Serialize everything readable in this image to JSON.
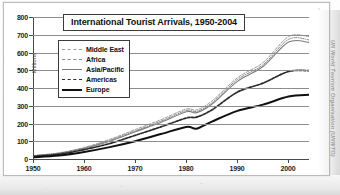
{
  "figure": {
    "title": "International Tourist Arrivals, 1950-2004",
    "credit": "UN World Tourism Organisation (UNWTO)"
  },
  "chart_data": {
    "type": "line",
    "title": "International Tourist Arrivals, 1950-2004",
    "xlabel": "",
    "ylabel": "Millions",
    "xlim": [
      1950,
      2004
    ],
    "ylim": [
      0,
      800
    ],
    "grid": true,
    "legend_position": "upper-left-inside",
    "xticks": [
      1950,
      1960,
      1970,
      1980,
      1990,
      2000
    ],
    "yticks": [
      0,
      100,
      200,
      300,
      400,
      500,
      600,
      700,
      800
    ],
    "x": [
      1950,
      1955,
      1960,
      1965,
      1970,
      1975,
      1980,
      1982,
      1985,
      1990,
      1995,
      2000,
      2004
    ],
    "series": [
      {
        "name": "Middle East",
        "style": "dashed-light",
        "color": "#9a9a9a",
        "values": [
          25,
          40,
          70,
          115,
          170,
          225,
          285,
          280,
          330,
          460,
          545,
          690,
          690
        ]
      },
      {
        "name": "Africa",
        "style": "dash-dot-light",
        "color": "#8a8a8a",
        "values": [
          24,
          38,
          67,
          110,
          163,
          217,
          277,
          272,
          320,
          450,
          533,
          675,
          672
        ]
      },
      {
        "name": "Asia/Pacific",
        "style": "solid-grey",
        "color": "#7d7d7d",
        "values": [
          23,
          36,
          64,
          105,
          158,
          210,
          270,
          265,
          312,
          440,
          523,
          660,
          658
        ]
      },
      {
        "name": "Americas",
        "style": "dashed-dark",
        "color": "#2a2a2a",
        "values": [
          20,
          32,
          58,
          92,
          138,
          185,
          235,
          240,
          280,
          380,
          430,
          495,
          500
        ]
      },
      {
        "name": "Europe",
        "style": "solid-bold",
        "color": "#101010",
        "values": [
          15,
          25,
          45,
          72,
          105,
          145,
          185,
          175,
          215,
          275,
          310,
          355,
          365
        ]
      }
    ]
  },
  "axes": {
    "y_title": "Millions",
    "y_labels": [
      "800",
      "700",
      "600",
      "500",
      "400",
      "300",
      "200",
      "100",
      "0"
    ],
    "x_labels": [
      "1950",
      "1960",
      "1970",
      "1980",
      "1990",
      "2000"
    ]
  },
  "legend": {
    "items": [
      {
        "label": "Middle East"
      },
      {
        "label": "Africa"
      },
      {
        "label": "Asia/Pacific"
      },
      {
        "label": "Americas"
      },
      {
        "label": "Europe"
      }
    ]
  }
}
